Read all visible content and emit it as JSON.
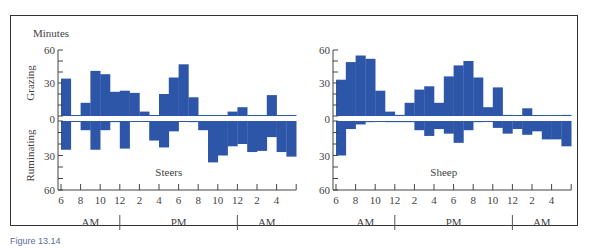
{
  "figure": {
    "caption": "Figure 13.14",
    "y_unit_label": "Minutes",
    "ylabel_top": "Grazing",
    "ylabel_bottom": "Ruminating",
    "bar_color": "#2e56a8",
    "panels": [
      {
        "name": "Steers"
      },
      {
        "name": "Sheep"
      }
    ],
    "xtick_labels": [
      "6",
      "8",
      "10",
      "12",
      "2",
      "4",
      "6",
      "8",
      "10",
      "12",
      "2",
      "4"
    ],
    "period_labels": [
      "AM",
      "PM",
      "AM"
    ],
    "ytick_labels": [
      "60",
      "30",
      "0",
      "30",
      "60"
    ]
  },
  "chart_data": [
    {
      "type": "bar",
      "title": "Steers",
      "xlabel": "Time of day (hourly, 6 AM to 6 AM)",
      "ylabel": "Minutes",
      "ylim_grazing": [
        0,
        60
      ],
      "ylim_ruminating": [
        0,
        60
      ],
      "x": [
        "6AM",
        "7AM",
        "8AM",
        "9AM",
        "10AM",
        "11AM",
        "12PM",
        "1PM",
        "2PM",
        "3PM",
        "4PM",
        "5PM",
        "6PM",
        "7PM",
        "8PM",
        "9PM",
        "10PM",
        "11PM",
        "12AM",
        "1AM",
        "2AM",
        "3AM",
        "4AM",
        "5AM"
      ],
      "series": [
        {
          "name": "Grazing",
          "direction": "up",
          "values": [
            34,
            0,
            12,
            41,
            38,
            22,
            23,
            21,
            4,
            0,
            20,
            35,
            47,
            17,
            0,
            0,
            0,
            4,
            8,
            0,
            0,
            19,
            0,
            0
          ]
        },
        {
          "name": "Ruminating",
          "direction": "down",
          "values": [
            25,
            0,
            8,
            25,
            8,
            1,
            24,
            0,
            0,
            17,
            23,
            9,
            0,
            1,
            8,
            36,
            30,
            22,
            20,
            27,
            26,
            14,
            27,
            31
          ]
        }
      ],
      "grid": false,
      "legend": "none"
    },
    {
      "type": "bar",
      "title": "Sheep",
      "xlabel": "Time of day (hourly, 6 AM to 6 AM)",
      "ylabel": "Minutes",
      "ylim_grazing": [
        0,
        60
      ],
      "ylim_ruminating": [
        0,
        60
      ],
      "x": [
        "6AM",
        "7AM",
        "8AM",
        "9AM",
        "10AM",
        "11AM",
        "12PM",
        "1PM",
        "2PM",
        "3PM",
        "4PM",
        "5PM",
        "6PM",
        "7PM",
        "8PM",
        "9PM",
        "10PM",
        "11PM",
        "12AM",
        "1AM",
        "2AM",
        "3AM",
        "4AM",
        "5AM"
      ],
      "series": [
        {
          "name": "Grazing",
          "direction": "up",
          "values": [
            33,
            49,
            55,
            52,
            23,
            4,
            1,
            12,
            24,
            27,
            12,
            36,
            46,
            50,
            35,
            8,
            26,
            1,
            0,
            7,
            0,
            0,
            0,
            1
          ]
        },
        {
          "name": "Ruminating",
          "direction": "down",
          "values": [
            30,
            7,
            3,
            1,
            0,
            1,
            1,
            1,
            8,
            13,
            7,
            11,
            19,
            8,
            1,
            0,
            6,
            11,
            7,
            12,
            9,
            16,
            16,
            22
          ]
        }
      ],
      "grid": false,
      "legend": "none"
    }
  ]
}
